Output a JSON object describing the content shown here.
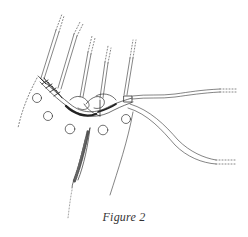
{
  "figure": {
    "caption": "Figure 2",
    "style": "line-art illustration",
    "colors": {
      "ink": "#333333",
      "background": "#ffffff"
    },
    "elements": {
      "vertical_cords": 5,
      "beads": 7,
      "trailing_cords": 2,
      "tassel": 1
    }
  }
}
